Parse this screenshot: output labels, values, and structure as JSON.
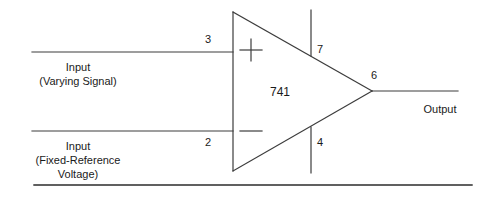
{
  "diagram": {
    "type": "circuit-schematic",
    "component": {
      "chip_label": "741",
      "shape": "triangle",
      "noninverting_symbol": "+",
      "inverting_symbol": "−"
    },
    "pins": [
      {
        "number": "3",
        "name": "noninverting-input",
        "side": "left-top"
      },
      {
        "number": "2",
        "name": "inverting-input",
        "side": "left-bottom"
      },
      {
        "number": "7",
        "name": "positive-supply",
        "side": "top"
      },
      {
        "number": "4",
        "name": "negative-supply",
        "side": "bottom"
      },
      {
        "number": "6",
        "name": "output",
        "side": "right"
      }
    ],
    "labels": {
      "input_varying_line1": "Input",
      "input_varying_line2": "(Varying Signal)",
      "input_fixed_line1": "Input",
      "input_fixed_line2": "(Fixed-Reference",
      "input_fixed_line3": "Voltage)",
      "output": "Output"
    },
    "colors": {
      "line": "#3c3c3c",
      "text": "#1a1a1a",
      "background": "#ffffff",
      "rule": "#2b2b2b"
    }
  }
}
